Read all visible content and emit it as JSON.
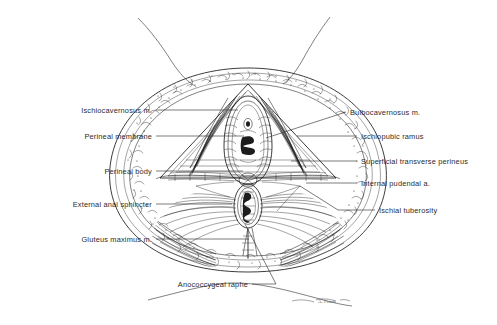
{
  "figure": {
    "background_color": "#ffffff",
    "ink_color": "#1a1a1a",
    "label_color": "#2b2b2b",
    "signature": "A. Frank"
  },
  "labels_left": [
    {
      "id": "ischiocavernosus",
      "text": "Ischiocavernosus m.",
      "text_x": 152,
      "text_y": 113,
      "leader": "M156,110 L238,110"
    },
    {
      "id": "perineal-membrane",
      "text": "Perineal membrane",
      "text_x": 152,
      "text_y": 139,
      "leader": "M156,136 L244,136"
    },
    {
      "id": "perineal-body",
      "text": "Perineal body",
      "text_x": 152,
      "text_y": 174,
      "leader": "M156,171 L243,171"
    },
    {
      "id": "external-anal-sphincter",
      "text": "External anal sphincter",
      "text_x": 152,
      "text_y": 207,
      "leader": "M156,204 L232,204"
    },
    {
      "id": "gluteus-maximus",
      "text": "Gluteus maximus m.",
      "text_x": 152,
      "text_y": 242,
      "leader": "M156,239 L249,239"
    },
    {
      "id": "anococcygeal-raphe",
      "text": "Anococcygeal raphe",
      "text_x": 248,
      "text_y": 287,
      "leader": "M252,284 L276,284 L245,224"
    }
  ],
  "labels_right": [
    {
      "id": "bulbocavernosus",
      "text": "Bulbocavernosus m.",
      "text_x": 350,
      "text_y": 115,
      "leader": "M346,112 L266,138"
    },
    {
      "id": "ischiopubic-ramus",
      "text": "Ischiopubic ramus",
      "text_x": 361,
      "text_y": 139,
      "leader": "M357,136 L297,136"
    },
    {
      "id": "superficial-transverse-perineus",
      "text": "Superficial transverse perineus",
      "text_x": 361,
      "text_y": 164,
      "leader": "M357,161 L291,161"
    },
    {
      "id": "internal-pudendal",
      "text": "Internal pudendal a.",
      "text_x": 361,
      "text_y": 186,
      "leader": "M357,183 L306,183"
    },
    {
      "id": "ischial-tuberosity",
      "text": "Ischial tuberosity",
      "text_x": 379,
      "text_y": 213,
      "leader": "M375,210 L338,210 L300,186"
    }
  ],
  "structures": [
    {
      "id": "thigh-contour-left",
      "name": "left thigh contour"
    },
    {
      "id": "thigh-contour-right",
      "name": "right thigh contour"
    },
    {
      "id": "subcutaneous-fat-ring",
      "name": "stippled subcutaneous fat border"
    },
    {
      "id": "vulval-cleft",
      "name": "vestibule / vaginal orifice"
    },
    {
      "id": "anal-canal",
      "name": "anal orifice"
    },
    {
      "id": "urogenital-triangle",
      "name": "urogenital triangle"
    },
    {
      "id": "anal-triangle",
      "name": "anal triangle"
    }
  ]
}
